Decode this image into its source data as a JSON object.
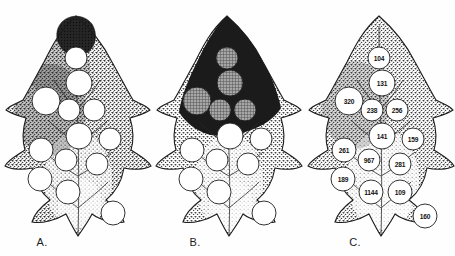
{
  "figure": {
    "background_color": "#fefefe",
    "ink_color": "#1c1c1c",
    "panel_count": 3
  },
  "panels": [
    {
      "id": "A",
      "label": "A.",
      "description": "Leaf outline with stippled mesophyll texture, one small dark shaded patch at the leaf apex and thirteen unshaded (white) circular regions.",
      "dark_patch_count": 1,
      "white_circle_count": 13,
      "shaded_circle_count": 0,
      "circles": [
        {
          "index": 1,
          "cx": 76,
          "cy": 58,
          "r": 11,
          "fill": "white"
        },
        {
          "index": 2,
          "cx": 79,
          "cy": 83,
          "r": 13,
          "fill": "white"
        },
        {
          "index": 3,
          "cx": 46,
          "cy": 101,
          "r": 14,
          "fill": "white"
        },
        {
          "index": 4,
          "cx": 69,
          "cy": 110,
          "r": 11,
          "fill": "white"
        },
        {
          "index": 5,
          "cx": 94,
          "cy": 110,
          "r": 11,
          "fill": "white"
        },
        {
          "index": 6,
          "cx": 79,
          "cy": 136,
          "r": 13,
          "fill": "white"
        },
        {
          "index": 7,
          "cx": 110,
          "cy": 139,
          "r": 11,
          "fill": "white"
        },
        {
          "index": 8,
          "cx": 41,
          "cy": 150,
          "r": 12,
          "fill": "white"
        },
        {
          "index": 9,
          "cx": 66,
          "cy": 160,
          "r": 11,
          "fill": "white"
        },
        {
          "index": 10,
          "cx": 97,
          "cy": 164,
          "r": 11,
          "fill": "white"
        },
        {
          "index": 11,
          "cx": 40,
          "cy": 179,
          "r": 12,
          "fill": "white"
        },
        {
          "index": 12,
          "cx": 68,
          "cy": 192,
          "r": 12,
          "fill": "white"
        },
        {
          "index": 13,
          "cx": 113,
          "cy": 213,
          "r": 12,
          "fill": "white"
        }
      ]
    },
    {
      "id": "B",
      "label": "B.",
      "description": "Same leaf outline; upper half of the lamina is solid dark (heavily infested), with five mid-gray cross-hatched circles inside the dark zone and eight plain white circles in the lower half.",
      "dark_patch_count": 1,
      "white_circle_count": 8,
      "shaded_circle_count": 5,
      "circles": [
        {
          "index": 1,
          "cx": 76,
          "cy": 58,
          "r": 11,
          "fill": "gray"
        },
        {
          "index": 2,
          "cx": 79,
          "cy": 83,
          "r": 13,
          "fill": "gray"
        },
        {
          "index": 3,
          "cx": 46,
          "cy": 101,
          "r": 14,
          "fill": "gray"
        },
        {
          "index": 4,
          "cx": 69,
          "cy": 110,
          "r": 11,
          "fill": "gray"
        },
        {
          "index": 5,
          "cx": 94,
          "cy": 110,
          "r": 11,
          "fill": "gray"
        },
        {
          "index": 6,
          "cx": 79,
          "cy": 136,
          "r": 13,
          "fill": "white"
        },
        {
          "index": 7,
          "cx": 110,
          "cy": 139,
          "r": 11,
          "fill": "white"
        },
        {
          "index": 8,
          "cx": 41,
          "cy": 150,
          "r": 12,
          "fill": "white"
        },
        {
          "index": 9,
          "cx": 66,
          "cy": 160,
          "r": 11,
          "fill": "white"
        },
        {
          "index": 10,
          "cx": 97,
          "cy": 164,
          "r": 11,
          "fill": "white"
        },
        {
          "index": 11,
          "cx": 40,
          "cy": 179,
          "r": 12,
          "fill": "white"
        },
        {
          "index": 12,
          "cx": 68,
          "cy": 192,
          "r": 12,
          "fill": "white"
        },
        {
          "index": 13,
          "cx": 113,
          "cy": 213,
          "r": 12,
          "fill": "white"
        }
      ]
    },
    {
      "id": "C",
      "label": "C.",
      "description": "Same leaf outline with stippled texture; each of the thirteen white circles is labelled with a numeric value.",
      "dark_patch_count": 0,
      "white_circle_count": 13,
      "shaded_circle_count": 0,
      "circles": [
        {
          "index": 1,
          "cx": 76,
          "cy": 58,
          "r": 11,
          "fill": "white",
          "value": "104"
        },
        {
          "index": 2,
          "cx": 79,
          "cy": 83,
          "r": 13,
          "fill": "white",
          "value": "131"
        },
        {
          "index": 3,
          "cx": 46,
          "cy": 101,
          "r": 14,
          "fill": "white",
          "value": "320"
        },
        {
          "index": 4,
          "cx": 69,
          "cy": 110,
          "r": 11,
          "fill": "white",
          "value": "238"
        },
        {
          "index": 5,
          "cx": 94,
          "cy": 110,
          "r": 11,
          "fill": "white",
          "value": "256"
        },
        {
          "index": 6,
          "cx": 79,
          "cy": 136,
          "r": 13,
          "fill": "white",
          "value": "141"
        },
        {
          "index": 7,
          "cx": 110,
          "cy": 139,
          "r": 11,
          "fill": "white",
          "value": "159"
        },
        {
          "index": 8,
          "cx": 41,
          "cy": 150,
          "r": 12,
          "fill": "white",
          "value": "261"
        },
        {
          "index": 9,
          "cx": 66,
          "cy": 160,
          "r": 11,
          "fill": "white",
          "value": "967"
        },
        {
          "index": 10,
          "cx": 97,
          "cy": 164,
          "r": 11,
          "fill": "white",
          "value": "281"
        },
        {
          "index": 11,
          "cx": 40,
          "cy": 179,
          "r": 12,
          "fill": "white",
          "value": "189"
        },
        {
          "index": 12,
          "cx": 68,
          "cy": 192,
          "r": 12,
          "fill": "white",
          "value": "1144"
        },
        {
          "index": 13,
          "cx": 97,
          "cy": 192,
          "r": 12,
          "fill": "white",
          "value": "109"
        },
        {
          "index": 14,
          "cx": 122,
          "cy": 216,
          "r": 12,
          "fill": "white",
          "value": "160"
        }
      ]
    }
  ],
  "chart_data": {
    "type": "table",
    "categories": [
      "104",
      "131",
      "320",
      "238",
      "256",
      "141",
      "159",
      "261",
      "967",
      "281",
      "189",
      "1144",
      "109",
      "160"
    ],
    "values": [
      104,
      131,
      320,
      238,
      256,
      141,
      159,
      261,
      967,
      281,
      189,
      1144,
      109,
      160
    ],
    "xlabel": "",
    "ylabel": "",
    "legend": [
      "Panel A: undamaged leaf",
      "Panel B: damaged (dark) leaf",
      "Panel C: labelled counts"
    ]
  },
  "colors": {
    "paper": "#fefefe",
    "ink": "#1c1c1c",
    "dark_fill": "#1f1f1f",
    "gray_fill": "#8d8d8d",
    "white_fill": "#ffffff",
    "stipple": "#3a3a3a"
  }
}
